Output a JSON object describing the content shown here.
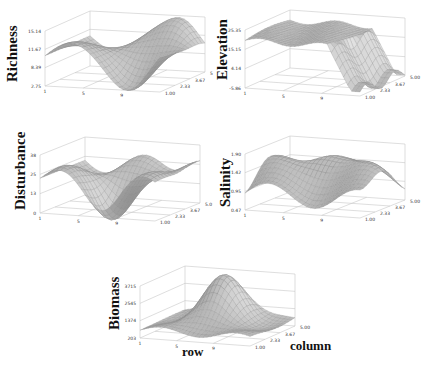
{
  "chart_data": [
    {
      "type": "surface3d",
      "title": "Richness",
      "zlabel": "Richness",
      "xlabel": "row",
      "ylabel": "column",
      "z_ticks": [
        "15.14",
        "11.67",
        "8.39",
        "2.75"
      ],
      "x_ticks": [
        "1",
        "5",
        "9"
      ],
      "y_ticks": [
        "1.00",
        "2.33",
        "3.67",
        "5"
      ],
      "zlim": [
        2.75,
        15.14
      ],
      "grid": true
    },
    {
      "type": "surface3d",
      "title": "Elevation",
      "zlabel": "Elevation",
      "xlabel": "row",
      "ylabel": "column",
      "z_ticks": [
        "25.35",
        "15.15",
        "4.14",
        "-5.86"
      ],
      "x_ticks": [
        "1",
        "5",
        "9"
      ],
      "y_ticks": [
        "1.00",
        "2.33",
        "3.67",
        "5.00"
      ],
      "zlim": [
        -5.86,
        25.35
      ],
      "grid": true
    },
    {
      "type": "surface3d",
      "title": "Disturbance",
      "zlabel": "Disturbance",
      "xlabel": "row",
      "ylabel": "column",
      "z_ticks": [
        "38",
        "25",
        "13",
        "0"
      ],
      "x_ticks": [
        "1",
        "5",
        "9"
      ],
      "y_ticks": [
        "1.00",
        "2.33",
        "3.67",
        "5.0"
      ],
      "zlim": [
        0,
        38
      ],
      "grid": true
    },
    {
      "type": "surface3d",
      "title": "Salinity",
      "zlabel": "Salinity",
      "xlabel": "row",
      "ylabel": "column",
      "z_ticks": [
        "1.90",
        "1.42",
        "0.95",
        "0.47"
      ],
      "x_ticks": [
        "1",
        "5",
        "9"
      ],
      "y_ticks": [
        "1.00",
        "2.33",
        "3.67",
        "5.00"
      ],
      "zlim": [
        0.47,
        1.9
      ],
      "grid": true
    },
    {
      "type": "surface3d",
      "title": "Biomass",
      "zlabel": "Biomass",
      "xlabel": "row",
      "ylabel": "column",
      "z_ticks": [
        "3715",
        "2545",
        "1374",
        "203"
      ],
      "x_ticks": [
        "1",
        "5",
        "9"
      ],
      "y_ticks": [
        "1.00",
        "2.33",
        "3.67",
        "5.00"
      ],
      "zlim": [
        203,
        3715
      ],
      "grid": true
    }
  ],
  "labels": {
    "richness": "Richness",
    "elevation": "Elevation",
    "disturbance": "Disturbance",
    "salinity": "Salinity",
    "biomass": "Biomass",
    "row": "row",
    "column": "column"
  },
  "colors": {
    "surface_fill": "#bdbdbd",
    "surface_dark": "#6e6e6e",
    "mesh_line": "#8a8a8a",
    "axis_line": "#c8c8c8"
  }
}
